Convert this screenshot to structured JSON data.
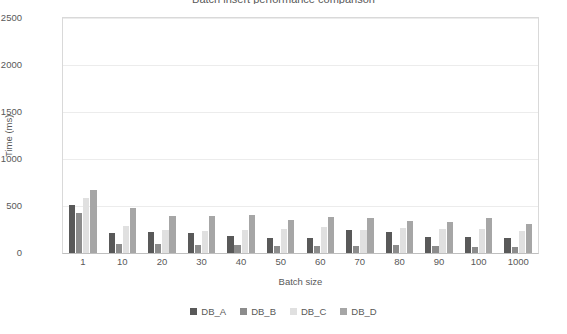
{
  "chart_data": {
    "type": "bar",
    "title": "Batch insert performance comparison",
    "xlabel": "Batch size",
    "ylabel": "Time (ms)",
    "ylim": [
      0,
      2500
    ],
    "y_ticks": [
      0,
      500,
      1000,
      1500,
      2000,
      2500
    ],
    "grid": true,
    "legend_position": "bottom",
    "categories": [
      "1",
      "10",
      "20",
      "30",
      "40",
      "50",
      "60",
      "70",
      "80",
      "90",
      "100",
      "1000"
    ],
    "series": [
      {
        "name": "DB_A",
        "color": "#595959",
        "values": [
          510,
          210,
          220,
          215,
          180,
          165,
          160,
          250,
          225,
          175,
          170,
          165
        ]
      },
      {
        "name": "DB_B",
        "color": "#8c8c8c",
        "values": [
          430,
          100,
          95,
          90,
          80,
          75,
          70,
          75,
          80,
          70,
          65,
          60
        ]
      },
      {
        "name": "DB_C",
        "color": "#e0e0e0",
        "values": [
          590,
          290,
          250,
          235,
          250,
          255,
          280,
          240,
          270,
          255,
          260,
          230
        ]
      },
      {
        "name": "DB_D",
        "color": "#a6a6a6",
        "values": [
          670,
          480,
          390,
          395,
          400,
          350,
          380,
          370,
          340,
          330,
          375,
          310
        ]
      }
    ]
  },
  "axis_colors": {
    "axis_line": "#d9d9d9",
    "gridline": "#ececec",
    "text": "#595959"
  }
}
